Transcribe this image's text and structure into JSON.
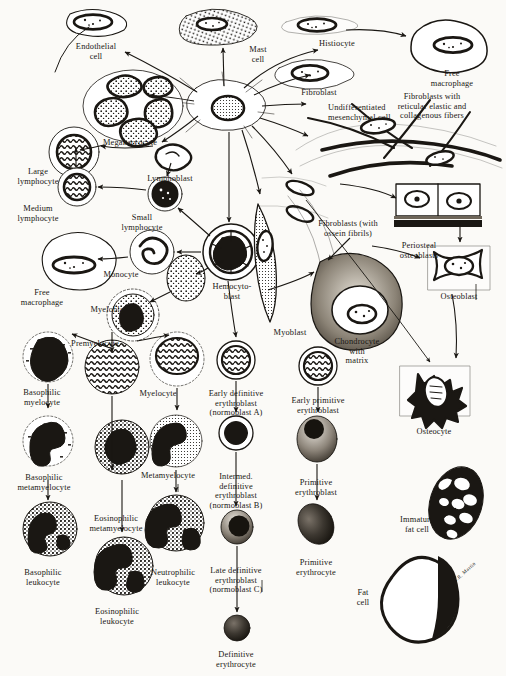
{
  "figure": {
    "background_color": "#fbfaf7",
    "ink_color": "#1a1713",
    "signature": "A.R. Martin"
  },
  "labels": [
    {
      "id": "endothelial-cell",
      "text": "Endothelial\ncell",
      "x": 96,
      "y": 42,
      "align": "center"
    },
    {
      "id": "mast-cell",
      "text": "Mast\ncell",
      "x": 258,
      "y": 45,
      "align": "center"
    },
    {
      "id": "histiocyte",
      "text": "Histiocyte",
      "x": 337,
      "y": 39,
      "align": "center"
    },
    {
      "id": "free-macrophage-top",
      "text": "Free\nmacrophage",
      "x": 452,
      "y": 69,
      "align": "center"
    },
    {
      "id": "fibroblast",
      "text": "Fibroblast",
      "x": 319,
      "y": 88,
      "align": "center"
    },
    {
      "id": "undifferentiated-mesenchymal-cell",
      "text": "Undifferentiated\nmesenchymal cell",
      "x": 328,
      "y": 103,
      "align": "left"
    },
    {
      "id": "fibroblasts-reticular",
      "text": "Fibroblasts with\nreticular elastic and\ncollagenous fibers",
      "x": 432,
      "y": 92,
      "align": "center"
    },
    {
      "id": "megakaryocyte",
      "text": "Megakaryocyte",
      "x": 130,
      "y": 138,
      "align": "center"
    },
    {
      "id": "large-lymphocyte",
      "text": "Large\nlymphocyte",
      "x": 38,
      "y": 167,
      "align": "center"
    },
    {
      "id": "lymphoblast",
      "text": "Lymphoblast",
      "x": 170,
      "y": 174,
      "align": "center"
    },
    {
      "id": "medium-lymphocyte",
      "text": "Medium\nlymphocyte",
      "x": 38,
      "y": 204,
      "align": "center"
    },
    {
      "id": "small-lymphocyte",
      "text": "Small\nlymphocyte",
      "x": 142,
      "y": 213,
      "align": "center"
    },
    {
      "id": "fibroblasts-ossein",
      "text": "Fibroblasts (with\nossein fibrils)",
      "x": 348,
      "y": 219,
      "align": "center"
    },
    {
      "id": "periosteal-osteoblasts",
      "text": "Periosteal\nosteoblasts",
      "x": 419,
      "y": 241,
      "align": "center"
    },
    {
      "id": "monocyte",
      "text": "Monocyte",
      "x": 121,
      "y": 270,
      "align": "center"
    },
    {
      "id": "hemocytoblast",
      "text": "Hemocyto-\nblast",
      "x": 232,
      "y": 282,
      "align": "center"
    },
    {
      "id": "free-macrophage-left",
      "text": "Free\nmacrophage",
      "x": 42,
      "y": 288,
      "align": "center"
    },
    {
      "id": "osteoblast",
      "text": "Osteoblast",
      "x": 459,
      "y": 292,
      "align": "center"
    },
    {
      "id": "myeloblast",
      "text": "Myeloblast",
      "x": 110,
      "y": 305,
      "align": "center"
    },
    {
      "id": "myoblast",
      "text": "Myoblast",
      "x": 290,
      "y": 328,
      "align": "center"
    },
    {
      "id": "chondrocyte-with-matrix",
      "text": "Chondrocyte\nwith\nmatrix",
      "x": 357,
      "y": 337,
      "align": "center"
    },
    {
      "id": "premyelocyte",
      "text": "Premyelocyte",
      "x": 95,
      "y": 339,
      "align": "center"
    },
    {
      "id": "basophilic-myelocyte",
      "text": "Basophilic\nmyelocyte",
      "x": 42,
      "y": 388,
      "align": "center"
    },
    {
      "id": "myelocyte",
      "text": "Myelocyte",
      "x": 158,
      "y": 389,
      "align": "center"
    },
    {
      "id": "early-definitive-erythroblast",
      "text": "Early definitive\nerythroblast\n(normoblast A)",
      "x": 236,
      "y": 389,
      "align": "center"
    },
    {
      "id": "early-primitive-erythroblast",
      "text": "Early primitive\nerythroblast",
      "x": 318,
      "y": 396,
      "align": "center"
    },
    {
      "id": "osteocyte",
      "text": "Osteocyte",
      "x": 434,
      "y": 427,
      "align": "center"
    },
    {
      "id": "basophilic-metamyelocyte",
      "text": "Basophilic\nmetamyelocyte",
      "x": 44,
      "y": 473,
      "align": "center"
    },
    {
      "id": "metamyelocyte",
      "text": "Metamyelocyte",
      "x": 168,
      "y": 471,
      "align": "center"
    },
    {
      "id": "intermed-definitive-erythroblast",
      "text": "Intermed.\ndefinitive\nerythroblast\n(normoblast B)",
      "x": 236,
      "y": 472,
      "align": "center"
    },
    {
      "id": "primitive-erythroblast",
      "text": "Primitive\nerythroblast",
      "x": 316,
      "y": 478,
      "align": "center"
    },
    {
      "id": "eosinophilic-metamyelocyte",
      "text": "Eosinophilic\nmetamyelocyte",
      "x": 116,
      "y": 514,
      "align": "center"
    },
    {
      "id": "immature-fat-cell",
      "text": "Immature\nfat cell",
      "x": 417,
      "y": 515,
      "align": "center"
    },
    {
      "id": "basophilic-leukocyte",
      "text": "Basophilic\nleukocyte",
      "x": 43,
      "y": 568,
      "align": "center"
    },
    {
      "id": "neutrophilic-leukocyte",
      "text": "Neutrophilic\nleukocyte",
      "x": 173,
      "y": 568,
      "align": "center"
    },
    {
      "id": "late-definitive-erythroblast",
      "text": "Late definitive\nerythroblast\n(normoblast C)",
      "x": 236,
      "y": 566,
      "align": "center"
    },
    {
      "id": "primitive-erythrocyte",
      "text": "Primitive\nerythrocyte",
      "x": 316,
      "y": 558,
      "align": "center"
    },
    {
      "id": "fat-cell",
      "text": "Fat\ncell",
      "x": 363,
      "y": 588,
      "align": "center"
    },
    {
      "id": "eosinophilic-leukocyte",
      "text": "Eosinophilic\nleukocyte",
      "x": 117,
      "y": 607,
      "align": "center"
    },
    {
      "id": "definitive-erythrocyte",
      "text": "Definitive\nerythrocyte",
      "x": 236,
      "y": 650,
      "align": "center"
    }
  ]
}
